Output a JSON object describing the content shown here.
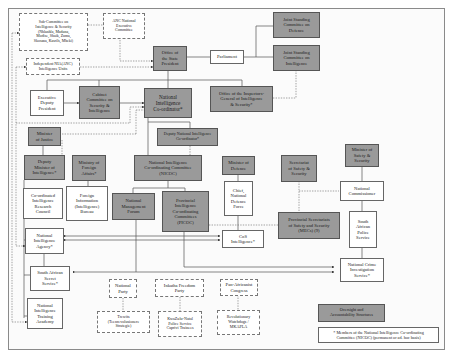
{
  "diagram": {
    "nodes": {
      "sub_committee": "Sub-Committee on\nIntelligence & Security\n(Nhlanhla, Maduna,\nModise, Shaik, Zuma,\nSkosana, Kasrils, Mbeki)",
      "anc_nec": "ANC National\nExecutive\nCommittee",
      "independent_units": "Independent NIA(ANC)\nIntelligence Units",
      "office_state_president": "Office of\nthe State\nPresident",
      "parliament": "Parliament",
      "jsc_defence": "Joint Standing\nCommittee on\nDefence",
      "jsc_intelligence": "Joint Standing\nCommittee on\nIntelligence",
      "executive_deputy_president": "Executive\nDeputy\nPresident",
      "cabinet_committee": "Cabinet\nCommittee on\nSecurity &\nIntelligence",
      "national_intelligence_coordinator": "National\nIntelligence\nCo-ordinator*",
      "inspector_general": "Office of the Inspectors-\nGeneral of Intelligence\n& Security*",
      "minister_justice": "Minister\nof Justice",
      "deputy_nic": "Deputy National Intelligence\nCo-ordinator*",
      "deputy_minister_intelligence": "Deputy\nMinister of\nIntelligence*",
      "minister_foreign_affairs": "Ministry of\nForeign\nAffairs*",
      "nicoc": "National Intelligence\nCo-ordinating Committee\n(NICOC)",
      "minister_defence": "Minister of\nDefence",
      "secretariat_safety": "Secretariat\nof Safety &\nSecurity",
      "minister_safety": "Minister of\nSafety &\nSecurity",
      "circ": "Co-ordinated\nIntelligence\nResearch\nCouncil",
      "foreign_info_bureau": "Foreign\nInformation\n(Intelligence)\nBureau",
      "national_management_forum": "National\nManagement\nForum",
      "picoc": "Provincial\nIntelligence\nCo-ordinating\nCommittees\n(PICOC)",
      "chief_sandf": "Chief,\nNational\nDefence\nForce",
      "national_commissioner": "National\nCommissioner",
      "provincial_secretariats": "Provincial Secretariats\nof Safety and Security\n(MECs) (9)",
      "nia": "National\nIntelligence\nAgency*",
      "cosi": "CoS\nIntelligence*",
      "saps": "South\nAfrican\nPolice\nService",
      "sass": "South African\nSecret\nService*",
      "ncis": "National Crime\nInvestigation\nService*",
      "national_party": "National\nParty",
      "ifp": "Inkatha Freedom\nParty",
      "pac": "Pan-Africanist\nCongress",
      "nita": "National\nIntelligence\nTraining\nAcademy",
      "trewits": "Trewits\n(Teenrevolusionere\nStrategie)",
      "kznps": "KwaZulu-Natal\nPolice Service\nCaprivi Trainees",
      "watchdogs": "Revolutionary\nWatchdogs /\nMKAPLA"
    },
    "legend": {
      "oversight_label": "Oversight and\nAccountability Structures",
      "footnote": "* Members of the National Intelligence Co-ordinating\nCommittee (NICOC) (permanent or ad. hoc basis)"
    },
    "colors": {
      "gray_box": "#9a9a9a",
      "line": "#555555"
    }
  }
}
